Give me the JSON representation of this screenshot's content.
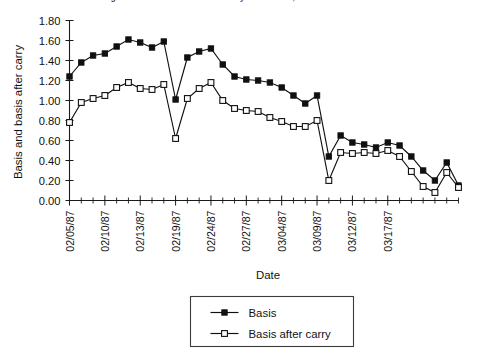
{
  "chart_data": {
    "type": "line",
    "title": "Figure 4. Basis and basis after carry for S&P 500, Jan.-Mar. 1987 data",
    "xlabel": "Date",
    "ylabel": "Basis and basis after carry",
    "ylim": [
      0.0,
      1.8
    ],
    "ytick_labels": [
      "0.00",
      "0.20",
      "0.40",
      "0.60",
      "0.80",
      "1.00",
      "1.20",
      "1.40",
      "1.60",
      "1.80"
    ],
    "ytick_values": [
      0.0,
      0.2,
      0.4,
      0.6,
      0.8,
      1.0,
      1.2,
      1.4,
      1.6,
      1.8
    ],
    "grid": false,
    "legend_position": "below-axes",
    "x_index_count": 34,
    "xtick_labels": [
      "02/05/87",
      "02/10/87",
      "02/13/87",
      "02/19/87",
      "02/24/87",
      "02/27/87",
      "03/04/87",
      "03/09/87",
      "03/12/87",
      "03/17/87"
    ],
    "xtick_indices": [
      0,
      3,
      6,
      9,
      12,
      15,
      18,
      21,
      24,
      27
    ],
    "series": [
      {
        "name": "Basis",
        "marker": "filled-square",
        "values": [
          1.24,
          1.38,
          1.45,
          1.47,
          1.54,
          1.61,
          1.58,
          1.53,
          1.59,
          1.01,
          1.43,
          1.49,
          1.52,
          1.36,
          1.24,
          1.21,
          1.2,
          1.18,
          1.13,
          1.05,
          0.97,
          1.05,
          0.44,
          0.65,
          0.58,
          0.56,
          0.53,
          0.58,
          0.55,
          0.44,
          0.3,
          0.2,
          0.38,
          0.15
        ]
      },
      {
        "name": "Basis after carry",
        "marker": "open-square",
        "values": [
          0.78,
          0.98,
          1.02,
          1.05,
          1.13,
          1.18,
          1.12,
          1.11,
          1.16,
          0.62,
          1.02,
          1.12,
          1.18,
          1.0,
          0.92,
          0.9,
          0.89,
          0.83,
          0.79,
          0.74,
          0.74,
          0.8,
          0.2,
          0.48,
          0.47,
          0.48,
          0.47,
          0.5,
          0.44,
          0.29,
          0.14,
          0.08,
          0.28,
          0.13
        ]
      }
    ]
  },
  "legend": {
    "entries": [
      {
        "label": "Basis"
      },
      {
        "label": "Basis after carry"
      }
    ]
  }
}
